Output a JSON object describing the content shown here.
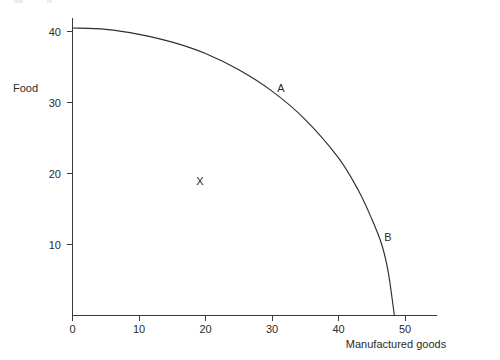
{
  "chart_data": {
    "type": "line",
    "title": "",
    "subtitle": "",
    "xlabel": "Manufactured goods",
    "ylabel": "Food",
    "xlim": [
      0,
      55
    ],
    "ylim": [
      0,
      44
    ],
    "xticks": [
      "0",
      "10",
      "20",
      "30",
      "40",
      "50"
    ],
    "xtick_values": [
      0,
      10,
      20,
      30,
      40,
      50
    ],
    "yticks": [
      "40",
      "30",
      "20",
      "10"
    ],
    "ytick_values": [
      40,
      30,
      20,
      10
    ],
    "grid": false,
    "legend": false,
    "legend_position": "none",
    "series": [
      {
        "name": "Production possibility frontier",
        "x": [
          0,
          5,
          10,
          15,
          20,
          25,
          30,
          35,
          40,
          43,
          45,
          46.5,
          47.5,
          48.4
        ],
        "values": [
          40.5,
          40.3,
          39.6,
          38.5,
          36.9,
          34.6,
          31.6,
          27.6,
          22.2,
          17.6,
          13.6,
          10.0,
          6.0,
          0
        ]
      }
    ],
    "annotations": [
      {
        "label": "A",
        "x": 30.5,
        "y": 33.0,
        "note": "point on frontier"
      },
      {
        "label": "B",
        "x": 47.0,
        "y": 12.2,
        "note": "point on frontier"
      },
      {
        "label": "X",
        "x": 19.0,
        "y": 20.0,
        "note": "point inside frontier"
      }
    ]
  },
  "axes": {
    "x_title": "Manufactured goods",
    "y_title": "Food"
  },
  "ticks": {
    "x": [
      {
        "label": "0"
      },
      {
        "label": "10"
      },
      {
        "label": "20"
      },
      {
        "label": "30"
      },
      {
        "label": "40"
      },
      {
        "label": "50"
      }
    ],
    "y": [
      {
        "label": "40"
      },
      {
        "label": "30"
      },
      {
        "label": "20"
      },
      {
        "label": "10"
      }
    ]
  },
  "points": {
    "a": "A",
    "b": "B",
    "x": "X"
  },
  "colors": {
    "curve": "#2e2e2e",
    "axis": "#3a3a3a",
    "text": "#2b2b2b",
    "background": "#ffffff"
  }
}
